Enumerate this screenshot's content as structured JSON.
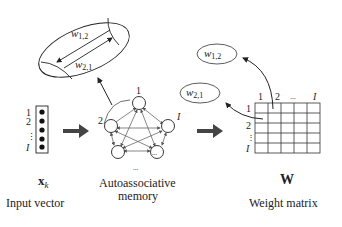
{
  "zoom_ellipse": {
    "upper_label": "w",
    "upper_sub": "1,2",
    "lower_label": "w",
    "lower_sub": "2,1"
  },
  "input_vector": {
    "row_labels": [
      "1",
      "2",
      "⋮",
      "I"
    ],
    "symbol": "x",
    "symbol_sub": "k",
    "caption": "Input vector"
  },
  "network": {
    "node_labels": {
      "top": "1",
      "left": "2",
      "right": "I",
      "bottom_right": "...",
      "below": "..."
    },
    "caption_line1": "Autoassociative",
    "caption_line2": "memory"
  },
  "weight_matrix": {
    "col_labels": [
      "1",
      "2",
      "...",
      "I"
    ],
    "row_labels": [
      "1",
      "2",
      "⋮",
      "I"
    ],
    "symbol": "W",
    "caption": "Weight matrix",
    "rows": 5,
    "cols": 5
  },
  "callouts": {
    "w12": {
      "label": "w",
      "sub": "1,2"
    },
    "w21": {
      "label": "w",
      "sub": "2,1"
    }
  },
  "colors": {
    "stroke": "#222222",
    "arrow_fill": "#444444",
    "edge": "#555555"
  }
}
